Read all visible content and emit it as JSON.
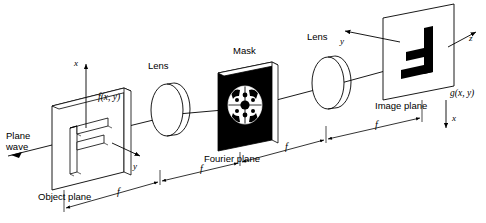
{
  "figure": {
    "background_color": "#ffffff",
    "line_color": "#000000",
    "mask_fill_color": "#000000",
    "mask_pattern_color": "#ffffff"
  },
  "labels": {
    "plane_wave": "Plane\nwave",
    "plane_wave_line1": "Plane",
    "plane_wave_line2": "wave",
    "object_plane": "Object plane",
    "input_function": "f(x, y)",
    "lens1": "Lens",
    "mask": "Mask",
    "fourier_plane": "Fourier plane",
    "lens2": "Lens",
    "image_plane": "Image plane",
    "output_function": "g(x, y)"
  },
  "axes": {
    "object_x": "x",
    "object_y": "y",
    "image_y": "y",
    "image_z": "z",
    "image_x": "x"
  },
  "dimensions": {
    "segment_label": "f",
    "segments": [
      {
        "id": "object-to-lens1",
        "label": "f"
      },
      {
        "id": "lens1-to-fourier",
        "label": "f"
      },
      {
        "id": "fourier-to-lens2",
        "label": "f"
      },
      {
        "id": "lens2-to-image",
        "label": "f"
      }
    ],
    "count": 4
  },
  "elements": [
    {
      "name": "object-plane",
      "label": "Object plane",
      "shape": "plate-with-F-aperture"
    },
    {
      "name": "lens-1",
      "label": "Lens",
      "shape": "ellipse-lens"
    },
    {
      "name": "fourier-plane-mask",
      "label": "Mask",
      "sublabel": "Fourier plane",
      "shape": "black-plate-with-circular-pattern"
    },
    {
      "name": "lens-2",
      "label": "Lens",
      "shape": "ellipse-lens"
    },
    {
      "name": "image-plane",
      "label": "Image plane",
      "shape": "plane-with-inverted-F"
    }
  ]
}
